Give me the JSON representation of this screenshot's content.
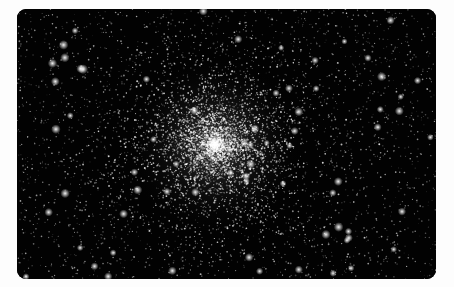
{
  "image": {
    "alt": "Globular star cluster against a black sky",
    "subject": "globular star cluster",
    "colors": {
      "background": "#fdfdfd",
      "sky": "#020202",
      "star": "#ffffff"
    },
    "cluster_center": {
      "x": 215,
      "y": 145
    }
  }
}
